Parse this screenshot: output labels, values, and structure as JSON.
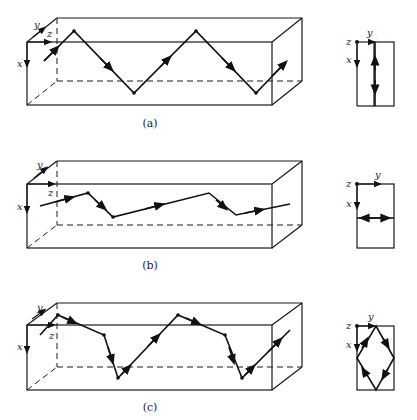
{
  "figure": {
    "panels": [
      {
        "id": "a",
        "caption": "(a)",
        "axes": {
          "x": "x",
          "y": "y",
          "z": "z"
        },
        "description": "Ray zigzags in x-z plane, reflecting off top and bottom walls",
        "cross_section": "vertical line with up/down arrows"
      },
      {
        "id": "b",
        "caption": "(b)",
        "axes": {
          "x": "x",
          "y": "y",
          "z": "z"
        },
        "description": "Ray zigzags in y-z plane at fixed x, reflecting off side walls",
        "cross_section": "horizontal line with left/right arrows"
      },
      {
        "id": "c",
        "caption": "(c)",
        "axes": {
          "x": "x",
          "y": "y",
          "z": "z"
        },
        "description": "Skew ray reflecting off all four walls",
        "cross_section": "diamond path with arrows"
      }
    ]
  }
}
